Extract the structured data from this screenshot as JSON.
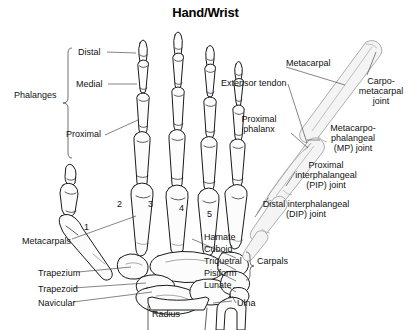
{
  "title": "Hand/Wrist",
  "image_type": "anatomical-line-diagram",
  "colors": {
    "background": "#ffffff",
    "line": "#1a1a1a",
    "text": "#111111",
    "bone_fill": "#fbfbfb",
    "shade": "#d8d8d8"
  },
  "views": {
    "palmar": "dorsal view of left hand skeleton",
    "lateral": "side view of a single finger ray"
  },
  "labels": {
    "phalanges_group": "Phalanges",
    "distal": "Distal",
    "medial": "Medial",
    "proximal": "Proximal",
    "metacarpals": "Metacarpals",
    "trapezium": "Trapezium",
    "trapezoid": "Trapezoid",
    "navicular": "Navicular",
    "radius": "Radius",
    "ulna": "Ulna",
    "hamate": "Hamate",
    "cuboid": "Cuboid",
    "triquetral": "Triquetral",
    "pisiform": "Pisiform",
    "lunate": "Lunate",
    "carpals_group": "Carpals",
    "metacarpal": "Metacarpal",
    "extensor_tendon": "Extensor tendon",
    "carpo_metacarpal_joint": "Carpo-\nmetacarpal\njoint",
    "proximal_phalanx": "Proximal\nphalanx",
    "mp_joint": "Metacarpo-\nphalangeal\n(MP) joint",
    "pip_joint": "Proximal\ninterphalangeal\n(PIP) joint",
    "dip_joint": "Distal interphalangeal\n(DIP) joint"
  },
  "metacarpal_numbers": [
    "1",
    "2",
    "3",
    "4",
    "5"
  ],
  "carpal_bone_list": [
    "Hamate",
    "Cuboid",
    "Triquetral",
    "Pisiform",
    "Lunate"
  ],
  "phalanx_segments": [
    "Distal",
    "Medial",
    "Proximal"
  ]
}
